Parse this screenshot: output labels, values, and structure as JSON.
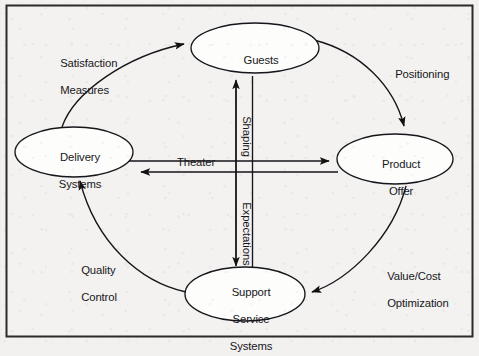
{
  "figure": {
    "frame": {
      "stroke": "#2b2b2b",
      "fill": "#f3f2f0"
    },
    "background_color": "#f2f1ef",
    "ink_color": "#17171a"
  },
  "nodes": [
    {
      "id": "guests",
      "label": "Guests",
      "lines": [
        "Guests"
      ],
      "cx": 255,
      "cy": 48,
      "rx": 64,
      "ry": 25
    },
    {
      "id": "delivery",
      "label": "Delivery Systems",
      "lines": [
        "Delivery",
        "Systems"
      ],
      "cx": 74,
      "cy": 152,
      "rx": 59,
      "ry": 25
    },
    {
      "id": "product",
      "label": "Product Offer",
      "lines": [
        "Product",
        "Offer"
      ],
      "cx": 395,
      "cy": 159,
      "rx": 58,
      "ry": 25
    },
    {
      "id": "support",
      "label": "Support Service Systems",
      "lines": [
        "Support",
        "Service",
        "Systems"
      ],
      "cx": 245,
      "cy": 294,
      "rx": 60,
      "ry": 27
    }
  ],
  "edge_labels": [
    {
      "id": "satisfaction-measures",
      "lines": [
        "Satisfaction",
        "Measures"
      ],
      "x": 48,
      "y": 44,
      "rotation": 0,
      "align": "left"
    },
    {
      "id": "positioning",
      "lines": [
        "Positioning"
      ],
      "x": 383,
      "y": 55,
      "rotation": 0,
      "align": "left"
    },
    {
      "id": "theater",
      "lines": [
        "Theater"
      ],
      "x": 165,
      "y": 143,
      "rotation": 0,
      "align": "left"
    },
    {
      "id": "shaping",
      "lines": [
        "Shaping"
      ],
      "x": 260,
      "y": 104,
      "rotation": 90,
      "align": "left"
    },
    {
      "id": "expectations",
      "lines": [
        "Expectations"
      ],
      "x": 260,
      "y": 190,
      "rotation": 90,
      "align": "left"
    },
    {
      "id": "quality-control",
      "lines": [
        "Quality",
        "Control"
      ],
      "x": 69,
      "y": 251,
      "rotation": 0,
      "align": "left"
    },
    {
      "id": "value-cost",
      "lines": [
        "Value/Cost",
        "Optimization"
      ],
      "x": 375,
      "y": 257,
      "rotation": 0,
      "align": "left"
    }
  ],
  "edges": [
    {
      "id": "delivery-to-guests",
      "label": "Satisfaction Measures",
      "from": "delivery",
      "to": "guests",
      "style": "curved",
      "arrows": "end"
    },
    {
      "id": "guests-to-product",
      "label": "Positioning",
      "from": "guests",
      "to": "product",
      "style": "curved",
      "arrows": "end"
    },
    {
      "id": "product-to-support",
      "label": "Value/Cost Optimization",
      "from": "product",
      "to": "support",
      "style": "curved",
      "arrows": "end"
    },
    {
      "id": "support-to-delivery",
      "label": "Quality Control",
      "from": "support",
      "to": "delivery",
      "style": "curved",
      "arrows": "end"
    },
    {
      "id": "delivery-product-pair",
      "label": "Theater",
      "from": "delivery",
      "to": "product",
      "style": "straight-pair-horizontal",
      "arrows": "both"
    },
    {
      "id": "guests-support-pair",
      "label": "Shaping / Expectations",
      "from": "guests",
      "to": "support",
      "style": "straight-pair-vertical",
      "arrows": "both"
    }
  ]
}
